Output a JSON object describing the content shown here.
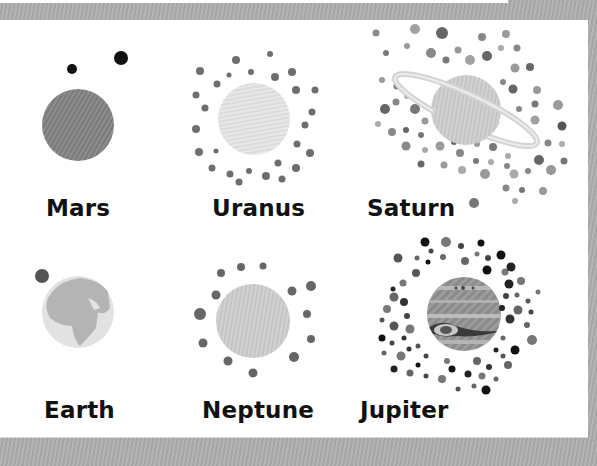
{
  "colors": {
    "frame": "#a9a9a9",
    "panel": "#ffffff",
    "label": "#111111",
    "moon_dark": "#4a4a4a",
    "moon_mid": "#707070",
    "moon_light": "#9a9a9a"
  },
  "planets": [
    {
      "name": "Mars",
      "icon": "mars-icon"
    },
    {
      "name": "Uranus",
      "icon": "uranus-icon"
    },
    {
      "name": "Saturn",
      "icon": "saturn-icon"
    },
    {
      "name": "Earth",
      "icon": "earth-icon"
    },
    {
      "name": "Neptune",
      "icon": "neptune-icon"
    },
    {
      "name": "Jupiter",
      "icon": "jupiter-icon"
    }
  ]
}
